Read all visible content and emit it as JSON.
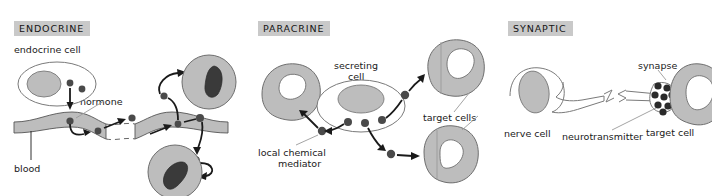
{
  "figure": {
    "background_color": "#ffffff",
    "title_badge_color": "#c9c9c9",
    "ink_color": "#1a1a1a",
    "cell_fill": "#bdbdbd",
    "nucleus_dark": "#3a3a3a",
    "signal_dot_color": "#4a4a4a",
    "leader_line_color": "#9a9a9a"
  },
  "panels": [
    {
      "id": "endocrine",
      "title": "ENDOCRINE",
      "labels": {
        "source_cell": "endocrine cell",
        "signal": "hormone",
        "transport": "blood"
      }
    },
    {
      "id": "paracrine",
      "title": "PARACRINE",
      "labels": {
        "source_cell_line1": "secreting",
        "source_cell_line2": "cell",
        "signal_line1": "local chemical",
        "signal_line2": "mediator",
        "targets": "target cells"
      }
    },
    {
      "id": "synaptic",
      "title": "SYNAPTIC",
      "labels": {
        "source_cell": "nerve cell",
        "junction": "synapse",
        "signal": "neurotransmitter",
        "target": "target cell"
      }
    }
  ]
}
